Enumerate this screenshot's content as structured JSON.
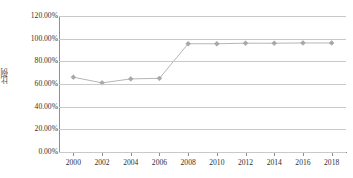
{
  "chart_data": {
    "type": "line",
    "title": "",
    "xlabel": "",
    "ylabel": "比例",
    "x": [
      2000,
      2002,
      2004,
      2006,
      2008,
      2010,
      2012,
      2014,
      2016,
      2018
    ],
    "categories": [
      "2000",
      "2002",
      "2004",
      "2006",
      "2008",
      "2010",
      "2012",
      "2014",
      "2016",
      "2018"
    ],
    "values": [
      0.66,
      0.61,
      0.645,
      0.65,
      0.955,
      0.955,
      0.96,
      0.96,
      0.962,
      0.962
    ],
    "value_labels": [
      "66.00%",
      "61.00%",
      "64.50%",
      "65.00%",
      "95.50%",
      "95.50%",
      "96.00%",
      "96.00%",
      "96.20%",
      "96.20%"
    ],
    "ylim": [
      0,
      1.2
    ],
    "ytick_values": [
      0,
      0.2,
      0.4,
      0.6,
      0.8,
      1.0,
      1.2
    ],
    "ytick_labels": [
      "0.00%",
      "20.00%",
      "40.00%",
      "60.00%",
      "80.00%",
      "100.00%",
      "120.00%"
    ],
    "xlim": [
      1999,
      2019
    ],
    "grid": "horizontal",
    "legend": "none",
    "series_color": "#b6b6b6",
    "marker_color": "#a8a8a8",
    "marker_shape": "diamond",
    "gridline_color": "#c9c9c9",
    "axis_color": "#8f8f8f",
    "background_color": "#ffffff"
  }
}
